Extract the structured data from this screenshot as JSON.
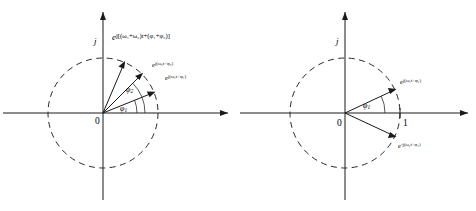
{
  "figure": {
    "background_color": "#ffffff",
    "line_color": "#1a1a1a",
    "dash_color": "#2a2a2a"
  },
  "panels": [
    {
      "id": "left",
      "name": "product-of-two-phasors",
      "origin_label": "0",
      "imaginary_axis_label": "j",
      "circle": {
        "radius_px": 55,
        "style": "dashed",
        "unit": 1
      },
      "angle_arcs": [
        {
          "name": "phi1",
          "label": "φ",
          "subscript": "1",
          "degrees": 22
        },
        {
          "name": "phi2",
          "label": "φ",
          "subscript": "2",
          "degrees": 45
        }
      ],
      "vectors": [
        {
          "name": "phasor-omega1",
          "degrees": 22,
          "magnitude": 1,
          "label_parts": {
            "base": "e",
            "exponent": "j(ω₁t+φ₁)"
          },
          "label_plain": "e^{j(ω₁t+φ₁)}",
          "label_size": "small"
        },
        {
          "name": "phasor-omega2",
          "degrees": 45,
          "magnitude": 1,
          "label_parts": {
            "base": "e",
            "exponent": "j(ω₂t+φ₂)"
          },
          "label_plain": "e^{j(ω₂t+φ₂)}",
          "label_size": "small"
        },
        {
          "name": "phasor-product",
          "degrees": 67,
          "magnitude": 1,
          "label_parts": {
            "base": "e",
            "exponent": "j[(ω₁+ω₂)t+(φ₁+φ₂)]"
          },
          "label_plain": "e^{j[(ω₁+ω₂)t+(φ₁+φ₂)]}",
          "label_size": "big"
        }
      ]
    },
    {
      "id": "right",
      "name": "conjugate-phasor-pair",
      "origin_label": "0",
      "imaginary_axis_label": "j",
      "unit_label": "1",
      "circle": {
        "radius_px": 55,
        "style": "dashed",
        "unit": 1
      },
      "angle_arcs": [
        {
          "name": "phi1",
          "label": "φ",
          "subscript": "1",
          "degrees": 25
        }
      ],
      "vectors": [
        {
          "name": "phasor-positive-frequency",
          "degrees": 25,
          "magnitude": 1,
          "label_parts": {
            "base": "e",
            "exponent": "j(ω₁t+φ₁)"
          },
          "label_plain": "e^{j(ω₁t+φ₁)}",
          "label_size": "small"
        },
        {
          "name": "phasor-negative-frequency",
          "degrees": -25,
          "magnitude": 1,
          "label_parts": {
            "base": "e",
            "exponent": "-j(ω₁t+φ₁)"
          },
          "label_plain": "e^{-j(ω₁t+φ₁)}",
          "label_size": "small"
        }
      ]
    }
  ]
}
